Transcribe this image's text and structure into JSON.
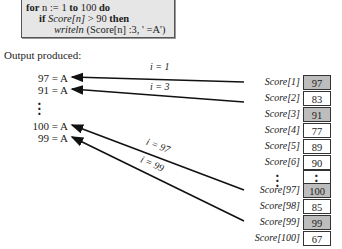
{
  "code": {
    "line1": {
      "kw1": "for",
      "var": " n ",
      "op": ":= 1 ",
      "kw2": "to",
      "num": " 100 ",
      "kw3": "do"
    },
    "line2": {
      "kw1": "if",
      "expr": " Score[n] ",
      "cmp": "> 90 ",
      "kw2": "then"
    },
    "line3": {
      "fn": "writeln",
      "args": " (Score[n] :3, ' =A')"
    }
  },
  "caption": "Output produced:",
  "outputs": [
    "97 = A",
    "91 = A",
    "100 = A",
    "99 = A"
  ],
  "arrows": [
    {
      "label": "i = 1",
      "from": "Score[1]",
      "to": "97 = A"
    },
    {
      "label": "i = 3",
      "from": "Score[3]",
      "to": "91 = A"
    },
    {
      "label": "i = 97",
      "from": "Score[97]",
      "to": "100 = A"
    },
    {
      "label": "i = 99",
      "from": "Score[99]",
      "to": "99 = A"
    }
  ],
  "array": [
    {
      "label": "Score[1]",
      "value": "97",
      "highlight": true
    },
    {
      "label": "Score[2]",
      "value": "83",
      "highlight": false
    },
    {
      "label": "Score[3]",
      "value": "91",
      "highlight": true
    },
    {
      "label": "Score[4]",
      "value": "77",
      "highlight": false
    },
    {
      "label": "Score[5]",
      "value": "89",
      "highlight": false
    },
    {
      "label": "Score[6]",
      "value": "90",
      "highlight": false
    },
    {
      "label": "Score[97]",
      "value": "100",
      "highlight": true
    },
    {
      "label": "Score[98]",
      "value": "85",
      "highlight": false
    },
    {
      "label": "Score[99]",
      "value": "99",
      "highlight": true
    },
    {
      "label": "Score[100]",
      "value": "67",
      "highlight": false
    }
  ],
  "colors": {
    "highlight": "#bdbdbd",
    "codebox": "#e6e6e6"
  }
}
